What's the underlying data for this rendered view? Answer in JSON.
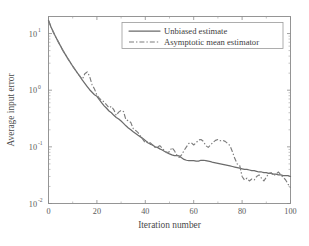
{
  "chart_data": {
    "type": "line",
    "title": "",
    "xlabel": "Iteration number",
    "ylabel": "Average input error",
    "xlim": [
      0,
      100
    ],
    "ylim": [
      0.01,
      20
    ],
    "yscale": "log",
    "xscale": "linear",
    "grid": false,
    "legend_position": "top-center",
    "xticks": [
      "0",
      "20",
      "40",
      "60",
      "80",
      "100"
    ],
    "xtick_values": [
      0,
      20,
      40,
      60,
      80,
      100
    ],
    "ytick_labels": [
      "10",
      "10",
      "10",
      "10"
    ],
    "ytick_exponents": [
      "1",
      "0",
      "-1",
      "-2"
    ],
    "ytick_values": [
      10,
      1,
      0.1,
      0.01
    ],
    "series": [
      {
        "name": "Unbiased estimate",
        "style": "solid",
        "color": "#6b6b6b",
        "x": [
          0,
          1,
          2,
          3,
          4,
          5,
          6,
          7,
          8,
          9,
          10,
          11,
          12,
          13,
          14,
          15,
          16,
          17,
          18,
          19,
          20,
          21,
          22,
          23,
          24,
          25,
          26,
          27,
          28,
          29,
          30,
          31,
          32,
          33,
          34,
          35,
          36,
          37,
          38,
          39,
          40,
          41,
          42,
          43,
          44,
          45,
          46,
          47,
          48,
          49,
          50,
          51,
          52,
          53,
          54,
          55,
          56,
          57,
          58,
          59,
          60,
          61,
          62,
          63,
          64,
          65,
          66,
          67,
          68,
          69,
          70,
          71,
          72,
          73,
          74,
          75,
          76,
          77,
          78,
          79,
          80,
          81,
          82,
          83,
          84,
          85,
          86,
          87,
          88,
          89,
          90,
          91,
          92,
          93,
          94,
          95,
          96,
          97,
          98,
          99,
          100
        ],
        "values": [
          17.0,
          13.2,
          10.6,
          8.7,
          7.2,
          6.0,
          5.0,
          4.25,
          3.6,
          3.1,
          2.65,
          2.3,
          2.0,
          1.75,
          1.5,
          1.32,
          1.16,
          1.02,
          0.92,
          0.83,
          0.78,
          0.68,
          0.6,
          0.53,
          0.48,
          0.43,
          0.4,
          0.36,
          0.33,
          0.31,
          0.285,
          0.26,
          0.235,
          0.215,
          0.2,
          0.185,
          0.172,
          0.16,
          0.15,
          0.14,
          0.13,
          0.118,
          0.112,
          0.108,
          0.1,
          0.098,
          0.092,
          0.088,
          0.083,
          0.079,
          0.075,
          0.072,
          0.07,
          0.07,
          0.069,
          0.064,
          0.06,
          0.058,
          0.057,
          0.057,
          0.057,
          0.056,
          0.056,
          0.058,
          0.058,
          0.057,
          0.056,
          0.055,
          0.053,
          0.052,
          0.051,
          0.05,
          0.049,
          0.048,
          0.047,
          0.046,
          0.045,
          0.044,
          0.043,
          0.042,
          0.041,
          0.04,
          0.04,
          0.039,
          0.038,
          0.038,
          0.037,
          0.036,
          0.036,
          0.035,
          0.035,
          0.034,
          0.034,
          0.033,
          0.033,
          0.032,
          0.032,
          0.031,
          0.031,
          0.031,
          0.03
        ]
      },
      {
        "name": "Asymptotic mean estimator",
        "style": "dashdot",
        "color": "#7d7d7d",
        "x": [
          0,
          1,
          2,
          3,
          4,
          5,
          6,
          7,
          8,
          9,
          10,
          11,
          12,
          13,
          14,
          15,
          16,
          17,
          18,
          19,
          20,
          21,
          22,
          23,
          24,
          25,
          26,
          27,
          28,
          29,
          30,
          31,
          32,
          33,
          34,
          35,
          36,
          37,
          38,
          39,
          40,
          41,
          42,
          43,
          44,
          45,
          46,
          47,
          48,
          49,
          50,
          51,
          52,
          53,
          54,
          55,
          56,
          57,
          58,
          59,
          60,
          61,
          62,
          63,
          64,
          65,
          66,
          67,
          68,
          69,
          70,
          71,
          72,
          73,
          74,
          75,
          76,
          77,
          78,
          79,
          80,
          81,
          82,
          83,
          84,
          85,
          86,
          87,
          88,
          89,
          90,
          91,
          92,
          93,
          94,
          95,
          96,
          97,
          98,
          99,
          100
        ],
        "values": [
          17.0,
          13.2,
          10.6,
          8.7,
          7.2,
          6.0,
          5.0,
          4.25,
          3.6,
          3.1,
          2.65,
          2.3,
          2.0,
          1.75,
          1.55,
          1.95,
          2.1,
          1.75,
          1.25,
          1.05,
          0.82,
          0.72,
          0.66,
          0.62,
          0.55,
          0.49,
          0.52,
          0.45,
          0.36,
          0.41,
          0.44,
          0.42,
          0.3,
          0.29,
          0.27,
          0.21,
          0.195,
          0.178,
          0.155,
          0.135,
          0.118,
          0.124,
          0.118,
          0.108,
          0.098,
          0.1,
          0.105,
          0.095,
          0.084,
          0.079,
          0.082,
          0.097,
          0.086,
          0.072,
          0.065,
          0.072,
          0.086,
          0.1,
          0.115,
          0.118,
          0.108,
          0.118,
          0.132,
          0.135,
          0.125,
          0.105,
          0.098,
          0.108,
          0.12,
          0.13,
          0.135,
          0.128,
          0.13,
          0.125,
          0.115,
          0.105,
          0.082,
          0.062,
          0.05,
          0.047,
          0.03,
          0.026,
          0.028,
          0.025,
          0.027,
          0.026,
          0.03,
          0.032,
          0.028,
          0.025,
          0.029,
          0.034,
          0.035,
          0.031,
          0.033,
          0.036,
          0.032,
          0.029,
          0.026,
          0.022,
          0.019
        ]
      }
    ]
  },
  "legend": {
    "entries": [
      {
        "label": "Unbiased estimate"
      },
      {
        "label": "Asymptotic mean estimator"
      }
    ]
  }
}
